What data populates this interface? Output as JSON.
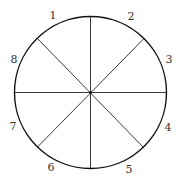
{
  "diagram": {
    "type": "divided-circle",
    "sectors": 8,
    "labels": [
      "1",
      "2",
      "3",
      "4",
      "5",
      "6",
      "7",
      "8"
    ]
  }
}
